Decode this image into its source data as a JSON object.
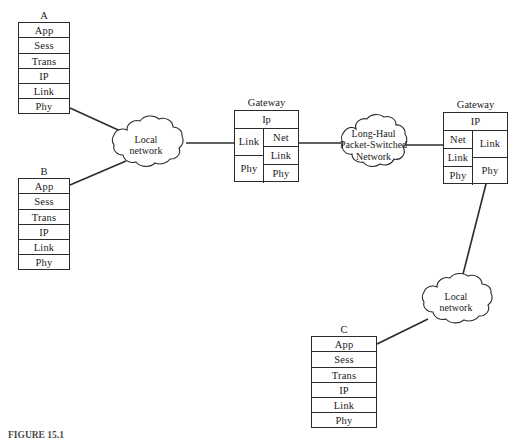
{
  "figure": {
    "caption": "FIGURE 15.1",
    "layer_names": [
      "App",
      "Sess",
      "Trans",
      "IP",
      "Link",
      "Phy"
    ]
  },
  "hosts": [
    {
      "id": "host-a",
      "label": "A",
      "layers": [
        "App",
        "Sess",
        "Trans",
        "IP",
        "Link",
        "Phy"
      ]
    },
    {
      "id": "host-b",
      "label": "B",
      "layers": [
        "App",
        "Sess",
        "Trans",
        "IP",
        "Link",
        "Phy"
      ]
    },
    {
      "id": "host-c",
      "label": "C",
      "layers": [
        "App",
        "Sess",
        "Trans",
        "IP",
        "Link",
        "Phy"
      ]
    }
  ],
  "gateways": [
    {
      "id": "gateway-left",
      "label": "Gateway",
      "top_layer": "Ip",
      "left_column": [
        "Link",
        "Phy"
      ],
      "right_column": [
        "Net",
        "Link",
        "Phy"
      ]
    },
    {
      "id": "gateway-right",
      "label": "Gateway",
      "top_layer": "IP",
      "left_column": [
        "Net",
        "Link",
        "Phy"
      ],
      "right_column": [
        "Link",
        "Phy"
      ]
    }
  ],
  "clouds": [
    {
      "id": "cloud-local-left",
      "lines": [
        "Local",
        "network"
      ]
    },
    {
      "id": "cloud-long-haul",
      "lines": [
        "Long-Haul",
        "Packet-Switched",
        "Network"
      ]
    },
    {
      "id": "cloud-local-bottom",
      "lines": [
        "Local",
        "network"
      ]
    }
  ],
  "style": {
    "line_color": "#2b2b2b",
    "background": "#ffffff"
  }
}
